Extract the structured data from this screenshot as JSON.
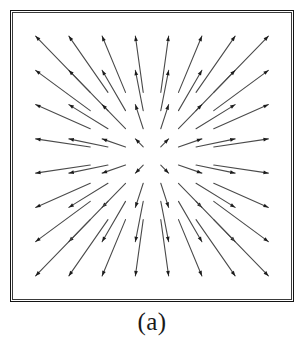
{
  "figure": {
    "caption": "(a)",
    "frame": {
      "x": 10,
      "y": 10,
      "width": 284,
      "height": 292,
      "border_color": "#141414",
      "background": "#ffffff"
    },
    "arrow_color": "#4a4a4a",
    "arrowhead_color": "#1c1c1c"
  },
  "chart_data": {
    "type": "scatter",
    "subtype": "quiver",
    "title": "",
    "subtitle": "",
    "xlabel": "",
    "ylabel": "",
    "caption": "(a)",
    "grid": false,
    "legend": null,
    "axis_ticks": false,
    "xlim": [
      -1,
      1
    ],
    "ylim": [
      -1,
      1
    ],
    "field": {
      "formula": "v = k * (x, y)",
      "scale": 0.47,
      "direction": "outward"
    },
    "grid_cols": 8,
    "grid_rows": 8,
    "x": [
      -0.875,
      -0.625,
      -0.375,
      -0.125,
      0.125,
      0.375,
      0.625,
      0.875
    ],
    "y": [
      0.875,
      0.625,
      0.375,
      0.125,
      -0.125,
      -0.375,
      -0.625,
      -0.875
    ],
    "points": [
      {
        "x": -0.875,
        "y": 0.875,
        "u": -0.411,
        "v": 0.411
      },
      {
        "x": -0.625,
        "y": 0.875,
        "u": -0.294,
        "v": 0.411
      },
      {
        "x": -0.375,
        "y": 0.875,
        "u": -0.176,
        "v": 0.411
      },
      {
        "x": -0.125,
        "y": 0.875,
        "u": -0.059,
        "v": 0.411
      },
      {
        "x": 0.125,
        "y": 0.875,
        "u": 0.059,
        "v": 0.411
      },
      {
        "x": 0.375,
        "y": 0.875,
        "u": 0.176,
        "v": 0.411
      },
      {
        "x": 0.625,
        "y": 0.875,
        "u": 0.294,
        "v": 0.411
      },
      {
        "x": 0.875,
        "y": 0.875,
        "u": 0.411,
        "v": 0.411
      },
      {
        "x": -0.875,
        "y": 0.625,
        "u": -0.411,
        "v": 0.294
      },
      {
        "x": -0.625,
        "y": 0.625,
        "u": -0.294,
        "v": 0.294
      },
      {
        "x": -0.375,
        "y": 0.625,
        "u": -0.176,
        "v": 0.294
      },
      {
        "x": -0.125,
        "y": 0.625,
        "u": -0.059,
        "v": 0.294
      },
      {
        "x": 0.125,
        "y": 0.625,
        "u": 0.059,
        "v": 0.294
      },
      {
        "x": 0.375,
        "y": 0.625,
        "u": 0.176,
        "v": 0.294
      },
      {
        "x": 0.625,
        "y": 0.625,
        "u": 0.294,
        "v": 0.294
      },
      {
        "x": 0.875,
        "y": 0.625,
        "u": 0.411,
        "v": 0.294
      },
      {
        "x": -0.875,
        "y": 0.375,
        "u": -0.411,
        "v": 0.176
      },
      {
        "x": -0.625,
        "y": 0.375,
        "u": -0.294,
        "v": 0.176
      },
      {
        "x": -0.375,
        "y": 0.375,
        "u": -0.176,
        "v": 0.176
      },
      {
        "x": -0.125,
        "y": 0.375,
        "u": -0.059,
        "v": 0.176
      },
      {
        "x": 0.125,
        "y": 0.375,
        "u": 0.059,
        "v": 0.176
      },
      {
        "x": 0.375,
        "y": 0.375,
        "u": 0.176,
        "v": 0.176
      },
      {
        "x": 0.625,
        "y": 0.375,
        "u": 0.294,
        "v": 0.176
      },
      {
        "x": 0.875,
        "y": 0.375,
        "u": 0.411,
        "v": 0.176
      },
      {
        "x": -0.875,
        "y": 0.125,
        "u": -0.411,
        "v": 0.059
      },
      {
        "x": -0.625,
        "y": 0.125,
        "u": -0.294,
        "v": 0.059
      },
      {
        "x": -0.375,
        "y": 0.125,
        "u": -0.176,
        "v": 0.059
      },
      {
        "x": -0.125,
        "y": 0.125,
        "u": -0.059,
        "v": 0.059
      },
      {
        "x": 0.125,
        "y": 0.125,
        "u": 0.059,
        "v": 0.059
      },
      {
        "x": 0.375,
        "y": 0.125,
        "u": 0.176,
        "v": 0.059
      },
      {
        "x": 0.625,
        "y": 0.125,
        "u": 0.294,
        "v": 0.059
      },
      {
        "x": 0.875,
        "y": 0.125,
        "u": 0.411,
        "v": 0.059
      },
      {
        "x": -0.875,
        "y": -0.125,
        "u": -0.411,
        "v": -0.059
      },
      {
        "x": -0.625,
        "y": -0.125,
        "u": -0.294,
        "v": -0.059
      },
      {
        "x": -0.375,
        "y": -0.125,
        "u": -0.176,
        "v": -0.059
      },
      {
        "x": -0.125,
        "y": -0.125,
        "u": -0.059,
        "v": -0.059
      },
      {
        "x": 0.125,
        "y": -0.125,
        "u": 0.059,
        "v": -0.059
      },
      {
        "x": 0.375,
        "y": -0.125,
        "u": 0.176,
        "v": -0.059
      },
      {
        "x": 0.625,
        "y": -0.125,
        "u": 0.294,
        "v": -0.059
      },
      {
        "x": 0.875,
        "y": -0.125,
        "u": 0.411,
        "v": -0.059
      },
      {
        "x": -0.875,
        "y": -0.375,
        "u": -0.411,
        "v": -0.176
      },
      {
        "x": -0.625,
        "y": -0.375,
        "u": -0.294,
        "v": -0.176
      },
      {
        "x": -0.375,
        "y": -0.375,
        "u": -0.176,
        "v": -0.176
      },
      {
        "x": -0.125,
        "y": -0.375,
        "u": -0.059,
        "v": -0.176
      },
      {
        "x": 0.125,
        "y": -0.375,
        "u": 0.059,
        "v": -0.176
      },
      {
        "x": 0.375,
        "y": -0.375,
        "u": 0.176,
        "v": -0.176
      },
      {
        "x": 0.625,
        "y": -0.375,
        "u": 0.294,
        "v": -0.176
      },
      {
        "x": 0.875,
        "y": -0.375,
        "u": 0.411,
        "v": -0.176
      },
      {
        "x": -0.875,
        "y": -0.625,
        "u": -0.411,
        "v": -0.294
      },
      {
        "x": -0.625,
        "y": -0.625,
        "u": -0.294,
        "v": -0.294
      },
      {
        "x": -0.375,
        "y": -0.625,
        "u": -0.176,
        "v": -0.294
      },
      {
        "x": -0.125,
        "y": -0.625,
        "u": -0.059,
        "v": -0.294
      },
      {
        "x": 0.125,
        "y": -0.625,
        "u": 0.059,
        "v": -0.294
      },
      {
        "x": 0.375,
        "y": -0.625,
        "u": 0.176,
        "v": -0.294
      },
      {
        "x": 0.625,
        "y": -0.625,
        "u": 0.294,
        "v": -0.294
      },
      {
        "x": 0.875,
        "y": -0.625,
        "u": 0.411,
        "v": -0.294
      },
      {
        "x": -0.875,
        "y": -0.875,
        "u": -0.411,
        "v": -0.411
      },
      {
        "x": -0.625,
        "y": -0.875,
        "u": -0.294,
        "v": -0.411
      },
      {
        "x": -0.375,
        "y": -0.875,
        "u": -0.176,
        "v": -0.411
      },
      {
        "x": -0.125,
        "y": -0.875,
        "u": -0.059,
        "v": -0.411
      },
      {
        "x": 0.125,
        "y": -0.875,
        "u": 0.059,
        "v": -0.411
      },
      {
        "x": 0.375,
        "y": -0.875,
        "u": 0.176,
        "v": -0.411
      },
      {
        "x": 0.625,
        "y": -0.875,
        "u": 0.294,
        "v": -0.411
      },
      {
        "x": 0.875,
        "y": -0.875,
        "u": 0.411,
        "v": -0.411
      }
    ]
  }
}
